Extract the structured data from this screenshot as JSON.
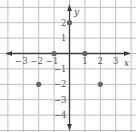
{
  "chart_data": {
    "type": "scatter",
    "title": "",
    "xlabel": "x",
    "ylabel": "y",
    "xlim": [
      -4.5,
      4.2
    ],
    "ylim": [
      -5,
      3.5
    ],
    "grid": true,
    "x_ticks": [
      -3,
      -2,
      -1,
      1,
      2,
      3
    ],
    "y_ticks": [
      2,
      1,
      -1,
      -2,
      -3,
      -4
    ],
    "series": [
      {
        "name": "points",
        "points": [
          {
            "x": 0,
            "y": 2
          },
          {
            "x": -1,
            "y": 0
          },
          {
            "x": 1,
            "y": 0
          },
          {
            "x": -2,
            "y": -2
          },
          {
            "x": 2,
            "y": -2
          }
        ]
      }
    ],
    "colors": {
      "grid": "#bdbdbd",
      "axis": "#3a3a3a",
      "point": "#666666"
    }
  }
}
